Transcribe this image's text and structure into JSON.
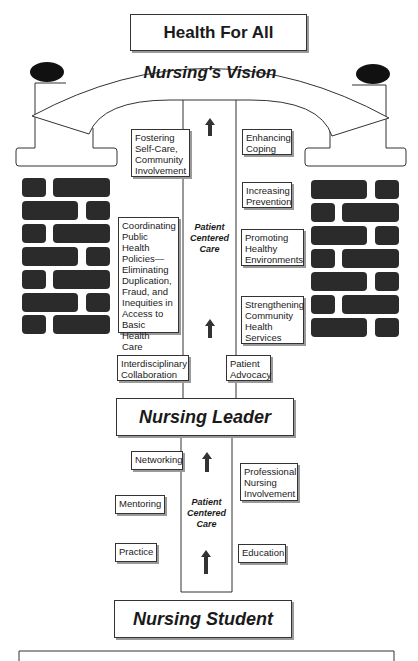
{
  "header": {
    "title": "Health For All"
  },
  "arch": {
    "label": "Nursing's Vision"
  },
  "vision_column": {
    "label": "Patient\nCentered\nCare",
    "left_items": [
      {
        "label": "Fostering\nSelf-Care,\nCommunity\nInvolvement"
      },
      {
        "label": "Coordinating\nPublic Health\nPolicies—\nEliminating\nDuplication,\nFraud, and\nInequities in\nAccess to\nBasic Health\nCare"
      },
      {
        "label": "Interdisciplinary\nCollaboration"
      }
    ],
    "right_items": [
      {
        "label": "Enhancing\nCoping"
      },
      {
        "label": "Increasing\nPrevention"
      },
      {
        "label": "Promoting\nHealthy\nEnvironments"
      },
      {
        "label": "Strengthening\nCommunity\nHealth\nServices"
      },
      {
        "label": "Patient\nAdvocacy"
      }
    ]
  },
  "leader": {
    "label": "Nursing Leader"
  },
  "student_column": {
    "label": "Patient\nCentered\nCare",
    "left_items": [
      {
        "label": "Networking"
      },
      {
        "label": "Mentoring"
      },
      {
        "label": "Practice"
      }
    ],
    "right_items": [
      {
        "label": "Professional\nNursing\nInvolvement"
      },
      {
        "label": "Education"
      }
    ]
  },
  "student": {
    "label": "Nursing Student"
  },
  "colors": {
    "brick": "#2b2b2b",
    "line": "#333333",
    "shadow": "#9a9a9a"
  }
}
